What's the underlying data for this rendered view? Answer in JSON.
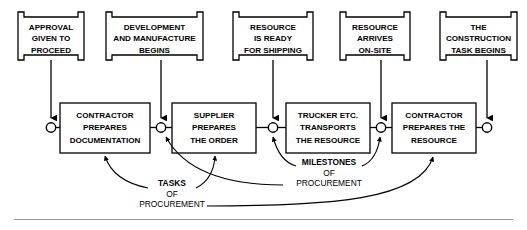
{
  "diagram": {
    "colors": {
      "stroke": "#000000",
      "fill": "#ffffff",
      "rule": "#9a9a9a"
    },
    "milestones": [
      {
        "id": "m1",
        "lines": [
          "APPROVAL",
          "GIVEN TO",
          "PROCEED"
        ]
      },
      {
        "id": "m2",
        "lines": [
          "DEVELOPMENT",
          "AND MANUFACTURE",
          "BEGINS"
        ]
      },
      {
        "id": "m3",
        "lines": [
          "RESOURCE",
          "IS READY",
          "FOR SHIPPING"
        ]
      },
      {
        "id": "m4",
        "lines": [
          "RESOURCE",
          "ARRIVES",
          "ON-SITE"
        ]
      },
      {
        "id": "m5",
        "lines": [
          "THE",
          "CONSTRUCTION",
          "TASK BEGINS"
        ]
      }
    ],
    "tasks": [
      {
        "id": "t1",
        "lines": [
          "CONTRACTOR",
          "PREPARES",
          "DOCUMENTATION"
        ]
      },
      {
        "id": "t2",
        "lines": [
          "SUPPLIER",
          "PREPARES",
          "THE ORDER"
        ]
      },
      {
        "id": "t3",
        "lines": [
          "TRUCKER ETC.",
          "TRANSPORTS",
          "THE RESOURCE"
        ]
      },
      {
        "id": "t4",
        "lines": [
          "CONTRACTOR",
          "PREPARES THE",
          "RESOURCE"
        ]
      }
    ],
    "annotations": [
      {
        "id": "tasks-annotation",
        "bold_line": "TASKS",
        "line2": "OF",
        "line3": "PROCUREMENT"
      },
      {
        "id": "milestones-annotation",
        "bold_line": "MILESTONES",
        "line2": "OF",
        "line3": "PROCUREMENT"
      }
    ]
  }
}
